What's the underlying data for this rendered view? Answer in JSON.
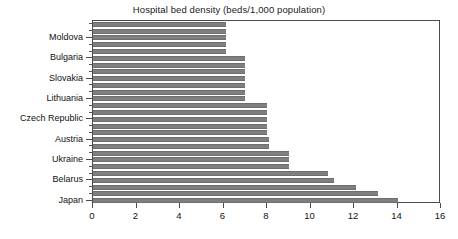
{
  "chart_data": {
    "type": "bar",
    "orientation": "horizontal",
    "title": "Hospital bed density (beds/1,000 population)",
    "xlabel": "",
    "ylabel": "",
    "xlim": [
      0,
      16
    ],
    "xticks": [
      0,
      2,
      4,
      6,
      8,
      10,
      12,
      14,
      16
    ],
    "xticklabels": [
      "0",
      "2",
      "4",
      "6",
      "8",
      "10",
      "12",
      "14",
      "16"
    ],
    "grid": false,
    "legend": null,
    "bar_color": "#7f7f7f",
    "labeled_categories": [
      "Moldova",
      "Bulgaria",
      "Slovakia",
      "Lithuania",
      "Czech Republic",
      "Austria",
      "Ukraine",
      "Belarus",
      "Japan"
    ],
    "categories": [
      "",
      "",
      "Moldova",
      "",
      "",
      "Bulgaria",
      "",
      "",
      "Slovakia",
      "",
      "",
      "Lithuania",
      "",
      "",
      "Czech Republic",
      "",
      "",
      "Austria",
      "",
      "",
      "Ukraine",
      "",
      "",
      "Belarus",
      "",
      "",
      "Japan"
    ],
    "values": [
      6.1,
      6.1,
      6.1,
      6.1,
      6.1,
      7.0,
      7.0,
      7.0,
      7.0,
      7.0,
      7.0,
      7.0,
      8.0,
      8.0,
      8.0,
      8.0,
      8.0,
      8.1,
      8.1,
      9.0,
      9.0,
      9.0,
      10.8,
      11.1,
      12.1,
      13.1,
      14.0
    ]
  }
}
